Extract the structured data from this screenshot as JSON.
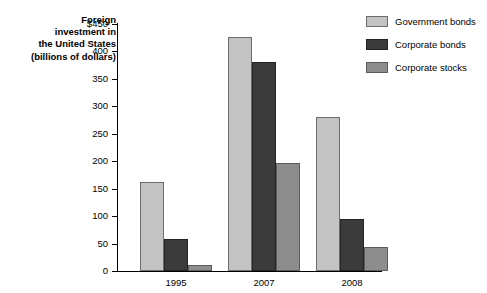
{
  "chart_data": {
    "type": "bar",
    "title": "Foreign investment in the United States (billions of dollars)",
    "title_lines": [
      "Foreign",
      "investment in",
      "the United States",
      "(billions of dollars)"
    ],
    "xlabel": "",
    "ylabel": "",
    "categories": [
      "1995",
      "2007",
      "2008"
    ],
    "series": [
      {
        "name": "Government bonds",
        "color": "#c3c3c3",
        "values": [
          163,
          427,
          281
        ]
      },
      {
        "name": "Corporate bonds",
        "color": "#3b3b3b",
        "values": [
          58,
          381,
          95
        ]
      },
      {
        "name": "Corporate stocks",
        "color": "#8d8d8d",
        "values": [
          11,
          196,
          44
        ]
      }
    ],
    "ylim": [
      0,
      450
    ],
    "y_ticks": [
      0,
      50,
      100,
      150,
      200,
      250,
      300,
      350,
      400,
      450
    ],
    "y_tick_labels": [
      "0",
      "50",
      "100",
      "150",
      "200",
      "250",
      "300",
      "350",
      "400",
      "$450"
    ],
    "grid": false,
    "legend_position": "right-top"
  }
}
